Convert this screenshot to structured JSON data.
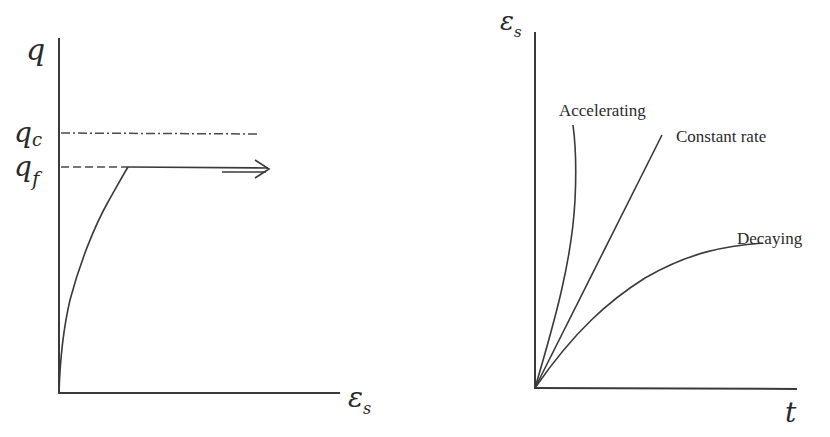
{
  "diagram": {
    "left_panel": {
      "y_axis_label": "q",
      "x_axis_label_main": "ε",
      "x_axis_label_sub": "s",
      "levels": [
        {
          "id": "q_c",
          "label_main": "q",
          "label_sub": "c",
          "style": "dash-dot"
        },
        {
          "id": "q_f",
          "label_main": "q",
          "label_sub": "f",
          "style": "dashed-then-solid-with-arrow"
        }
      ]
    },
    "right_panel": {
      "y_axis_label_main": "ε",
      "y_axis_label_sub": "s",
      "x_axis_label": "t",
      "curves": [
        {
          "id": "accelerating",
          "label": "Accelerating"
        },
        {
          "id": "constant",
          "label": "Constant rate"
        },
        {
          "id": "decaying",
          "label": "Decaying"
        }
      ]
    }
  },
  "colors": {
    "line": "#3a3a3a",
    "text": "#2a2a2a",
    "background": "#ffffff"
  }
}
